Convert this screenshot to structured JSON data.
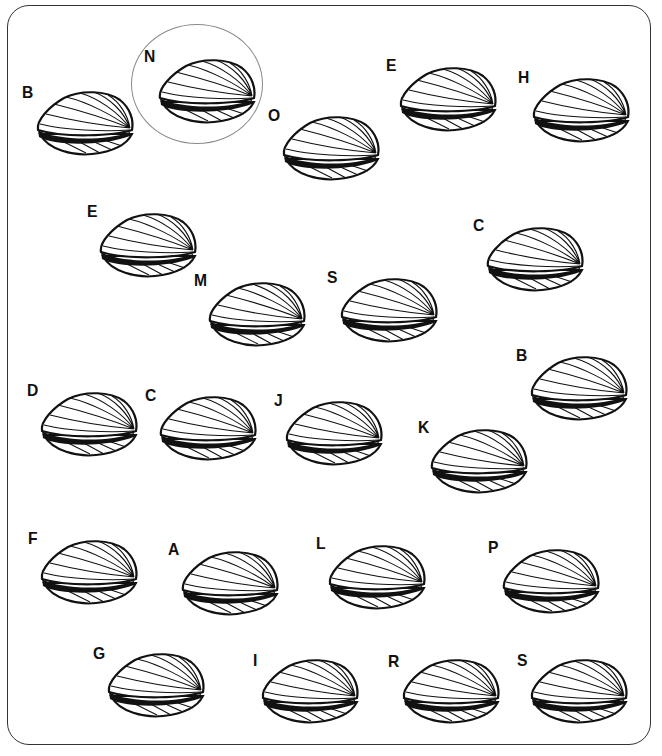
{
  "puzzle": {
    "type": "letter-labeled clam shells",
    "circled_example": "N",
    "colors": {
      "ink": "#111111",
      "frame": "#333333",
      "circle": "#8a8a8a",
      "background": "#ffffff"
    },
    "items": [
      {
        "letter": "B",
        "lx": 22,
        "ly": 84,
        "cx": 34,
        "cy": 90,
        "circled": false
      },
      {
        "letter": "N",
        "lx": 144,
        "ly": 48,
        "cx": 156,
        "cy": 58,
        "circled": true
      },
      {
        "letter": "O",
        "lx": 268,
        "ly": 107,
        "cx": 280,
        "cy": 115,
        "circled": false
      },
      {
        "letter": "E",
        "lx": 386,
        "ly": 57,
        "cx": 397,
        "cy": 66,
        "circled": false
      },
      {
        "letter": "H",
        "lx": 518,
        "ly": 69,
        "cx": 530,
        "cy": 77,
        "circled": false
      },
      {
        "letter": "E",
        "lx": 87,
        "ly": 203,
        "cx": 97,
        "cy": 212,
        "circled": false
      },
      {
        "letter": "C",
        "lx": 473,
        "ly": 217,
        "cx": 484,
        "cy": 226,
        "circled": false
      },
      {
        "letter": "M",
        "lx": 194,
        "ly": 272,
        "cx": 206,
        "cy": 281,
        "circled": false
      },
      {
        "letter": "S",
        "lx": 327,
        "ly": 269,
        "cx": 338,
        "cy": 277,
        "circled": false
      },
      {
        "letter": "B",
        "lx": 516,
        "ly": 347,
        "cx": 528,
        "cy": 355,
        "circled": false
      },
      {
        "letter": "D",
        "lx": 27,
        "ly": 382,
        "cx": 38,
        "cy": 391,
        "circled": false
      },
      {
        "letter": "C",
        "lx": 145,
        "ly": 387,
        "cx": 157,
        "cy": 395,
        "circled": false
      },
      {
        "letter": "J",
        "lx": 274,
        "ly": 392,
        "cx": 283,
        "cy": 400,
        "circled": false
      },
      {
        "letter": "K",
        "lx": 418,
        "ly": 419,
        "cx": 428,
        "cy": 428,
        "circled": false
      },
      {
        "letter": "F",
        "lx": 28,
        "ly": 530,
        "cx": 38,
        "cy": 539,
        "circled": false
      },
      {
        "letter": "A",
        "lx": 168,
        "ly": 541,
        "cx": 179,
        "cy": 550,
        "circled": false
      },
      {
        "letter": "L",
        "lx": 316,
        "ly": 535,
        "cx": 326,
        "cy": 544,
        "circled": false
      },
      {
        "letter": "P",
        "lx": 488,
        "ly": 539,
        "cx": 500,
        "cy": 548,
        "circled": false
      },
      {
        "letter": "G",
        "lx": 93,
        "ly": 645,
        "cx": 105,
        "cy": 652,
        "circled": false
      },
      {
        "letter": "I",
        "lx": 253,
        "ly": 652,
        "cx": 259,
        "cy": 658,
        "circled": false
      },
      {
        "letter": "R",
        "lx": 388,
        "ly": 653,
        "cx": 400,
        "cy": 658,
        "circled": false
      },
      {
        "letter": "S",
        "lx": 517,
        "ly": 652,
        "cx": 528,
        "cy": 658,
        "circled": false
      }
    ],
    "circle": {
      "x": 131,
      "y": 24,
      "w": 132,
      "h": 120
    }
  }
}
